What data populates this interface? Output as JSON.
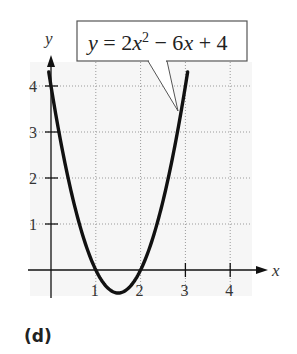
{
  "chart_data": {
    "type": "line",
    "title": "",
    "equation_label": "y = 2x² − 6x + 4",
    "equation_parts": {
      "pre": "y = 2x",
      "sup": "2",
      "post": " − 6x + 4"
    },
    "xlabel": "x",
    "ylabel": "y",
    "xlim": [
      -0.5,
      4.8
    ],
    "ylim": [
      -0.6,
      4.6
    ],
    "x_ticks": [
      "1",
      "2",
      "3",
      "4"
    ],
    "y_ticks": [
      "1",
      "2",
      "3",
      "4"
    ],
    "grid": true,
    "series": [
      {
        "name": "y = 2x^2 - 6x + 4",
        "x": [
          -0.05,
          0,
          0.25,
          0.5,
          0.75,
          1,
          1.25,
          1.5,
          1.75,
          2,
          2.25,
          2.5,
          2.75,
          3,
          3.05
        ],
        "y": [
          4.31,
          4,
          2.625,
          1.5,
          0.625,
          0,
          -0.375,
          -0.5,
          -0.375,
          0,
          0.625,
          1.5,
          2.625,
          4,
          4.31
        ]
      }
    ],
    "annotations": [
      {
        "text": "y = 2x² − 6x + 4",
        "points_to": [
          2.9,
          3.42
        ]
      }
    ]
  },
  "panel_label": "(d)"
}
